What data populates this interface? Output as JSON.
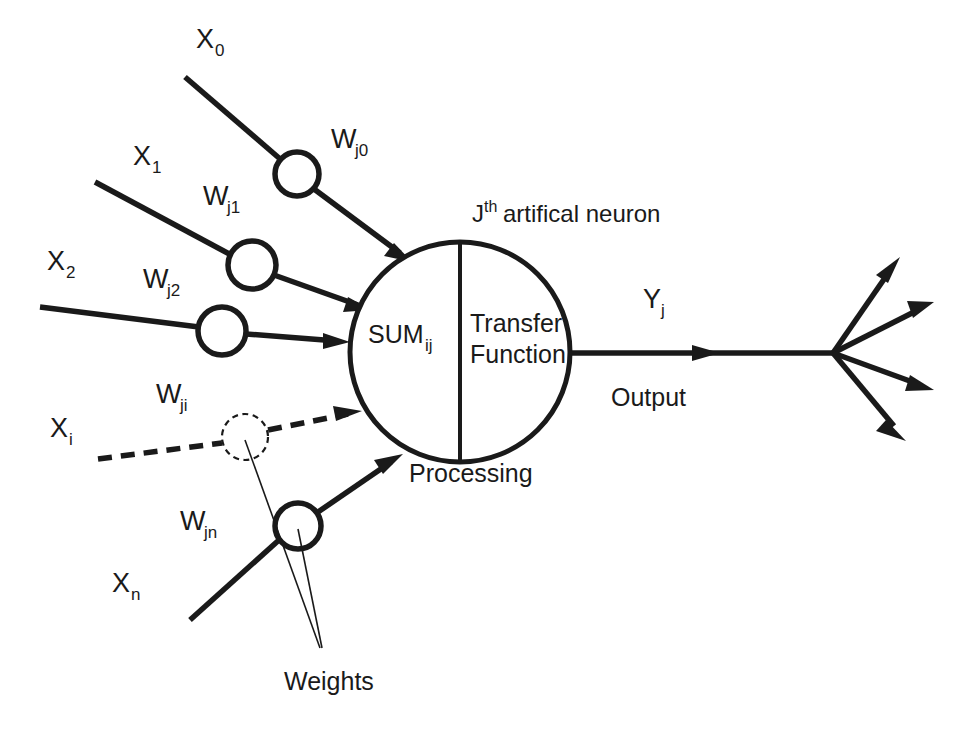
{
  "diagram": {
    "title_parts": {
      "main": "J",
      "sup": "th",
      "rest": "artifical neuron"
    },
    "background_color": "#ffffff",
    "ink_color": "#1a1a1a",
    "inputs": [
      {
        "id": "x0",
        "label": "X",
        "sub": "0",
        "weight_label": "W",
        "weight_sub": "j0",
        "style": "solid"
      },
      {
        "id": "x1",
        "label": "X",
        "sub": "1",
        "weight_label": "W",
        "weight_sub": "j1",
        "style": "solid"
      },
      {
        "id": "x2",
        "label": "X",
        "sub": "2",
        "weight_label": "W",
        "weight_sub": "j2",
        "style": "solid"
      },
      {
        "id": "xi",
        "label": "X",
        "sub": "i",
        "weight_label": "W",
        "weight_sub": "ji",
        "style": "dashed"
      },
      {
        "id": "xn",
        "label": "X",
        "sub": "n",
        "weight_label": "W",
        "weight_sub": "jn",
        "style": "solid"
      }
    ],
    "body": {
      "sum_label": "SUM",
      "sum_sub": "ij",
      "transfer_line1": "Transfer",
      "transfer_line2": "Function",
      "processing_label": "Processing"
    },
    "output": {
      "symbol": "Y",
      "symbol_sub": "j",
      "caption": "Output",
      "branch_count": 4
    },
    "annotations": {
      "weights_label": "Weights"
    }
  }
}
